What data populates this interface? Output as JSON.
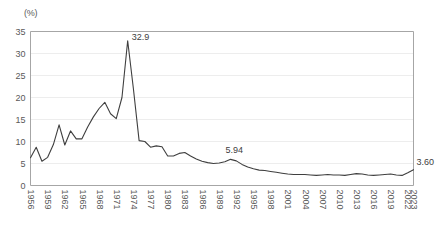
{
  "unit_label": "(%)",
  "colors": {
    "line": "#3f3f3f",
    "grid": "#ededed",
    "axis": "#a6a6a6",
    "tick_text": "#595959",
    "annotation_text": "#404040"
  },
  "annotations": {
    "peak": "32.9",
    "mid": "5.94",
    "last": "3.60"
  },
  "chart_data": {
    "type": "line",
    "title": "",
    "subtitle": "",
    "xlabel": "",
    "ylabel": "(%)",
    "ylim": [
      0,
      35
    ],
    "yticks": [
      0,
      5,
      10,
      15,
      20,
      25,
      30,
      35
    ],
    "grid": true,
    "legend": false,
    "legend_position": "none",
    "xtick_labels": [
      "1956",
      "1959",
      "1962",
      "1965",
      "1968",
      "1971",
      "1974",
      "1977",
      "1980",
      "1983",
      "1986",
      "1989",
      "1992",
      "1995",
      "1998",
      "2001",
      "2004",
      "2007",
      "2010",
      "2013",
      "2016",
      "2019",
      "2022",
      "2023"
    ],
    "xtick_rotation": 90,
    "x": [
      1956,
      1957,
      1958,
      1959,
      1960,
      1961,
      1962,
      1963,
      1964,
      1965,
      1966,
      1967,
      1968,
      1969,
      1970,
      1971,
      1972,
      1973,
      1974,
      1975,
      1976,
      1977,
      1978,
      1979,
      1980,
      1981,
      1982,
      1983,
      1984,
      1985,
      1986,
      1987,
      1988,
      1989,
      1990,
      1991,
      1992,
      1993,
      1994,
      1995,
      1996,
      1997,
      1998,
      1999,
      2000,
      2001,
      2002,
      2003,
      2004,
      2005,
      2006,
      2007,
      2008,
      2009,
      2010,
      2011,
      2012,
      2013,
      2014,
      2015,
      2016,
      2017,
      2018,
      2019,
      2020,
      2021,
      2022,
      2023
    ],
    "series": [
      {
        "name": "rate",
        "values": [
          6.3,
          8.7,
          5.5,
          6.4,
          9.3,
          13.8,
          9.2,
          12.4,
          10.6,
          10.6,
          13.3,
          15.6,
          17.5,
          18.9,
          16.3,
          15.2,
          20.0,
          32.9,
          22.0,
          10.2,
          10.0,
          8.7,
          9.0,
          8.8,
          6.7,
          6.7,
          7.3,
          7.5,
          6.7,
          6.0,
          5.5,
          5.2,
          5.0,
          5.1,
          5.4,
          5.94,
          5.6,
          4.8,
          4.2,
          3.8,
          3.5,
          3.4,
          3.2,
          3.0,
          2.8,
          2.6,
          2.5,
          2.5,
          2.5,
          2.4,
          2.3,
          2.4,
          2.5,
          2.4,
          2.4,
          2.3,
          2.5,
          2.7,
          2.6,
          2.4,
          2.3,
          2.4,
          2.5,
          2.6,
          2.4,
          2.3,
          2.9,
          3.6
        ]
      }
    ]
  }
}
